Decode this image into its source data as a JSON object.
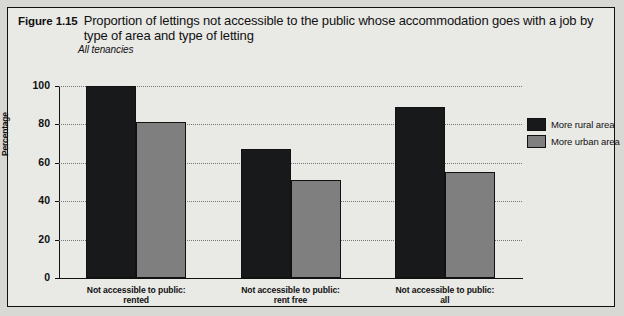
{
  "figure": {
    "number": "Figure 1.15",
    "title": "Proportion of lettings not accessible to the public whose accommodation goes with a job by type of area and type of letting",
    "subtitle": "All tenancies"
  },
  "chart_data": {
    "type": "bar",
    "title": "Proportion of lettings not accessible to the public whose accommodation goes with a job by type of area and type of letting",
    "subtitle": "All tenancies",
    "xlabel": "",
    "ylabel": "Percentage",
    "ylim": [
      0,
      100
    ],
    "yticks": [
      0,
      20,
      40,
      60,
      80,
      100
    ],
    "ytick_labels": [
      "0",
      "20",
      "40",
      "60",
      "80",
      "100"
    ],
    "grid": "horizontal-dotted",
    "legend_position": "right",
    "categories": [
      "Not accessible to public: rented",
      "Not accessible to public: rent free",
      "Not accessible to public: all"
    ],
    "category_lines": [
      [
        "Not accessible to public:",
        "rented"
      ],
      [
        "Not accessible to public:",
        "rent free"
      ],
      [
        "Not accessible to public:",
        "all"
      ]
    ],
    "series": [
      {
        "name": "More rural area",
        "color": "#17191a",
        "values": [
          100,
          67,
          89
        ]
      },
      {
        "name": "More urban area",
        "color": "#7e7f7e",
        "values": [
          81,
          51,
          55
        ]
      }
    ]
  }
}
